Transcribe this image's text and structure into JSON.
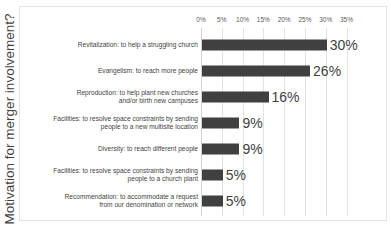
{
  "chart_data": {
    "type": "bar",
    "orientation": "horizontal",
    "title": "",
    "xlabel": "",
    "ylabel": "Motivation for merger involvement?",
    "xlim": [
      0,
      35
    ],
    "grid": true,
    "legend": "none",
    "x_ticks": [
      "0%",
      "5%",
      "10%",
      "15%",
      "20%",
      "25%",
      "30%",
      "35%"
    ],
    "x_tick_values": [
      0,
      5,
      10,
      15,
      20,
      25,
      30,
      35
    ],
    "categories": [
      "Revitalization: to help a struggling church",
      "Evangelism: to reach more people",
      "Reproduction: to help plant new churches and/or birth new campuses",
      "Facilities: to resolve space constraints by sending people to a new multisite location",
      "Diversity: to reach different people",
      "Facilities: to resolve space constraints by sending people to a church plant",
      "Recommendation: to accommodate a request from our denomination or network"
    ],
    "category_lines": [
      [
        "Revitalization: to help a struggling church"
      ],
      [
        "Evangelism: to reach more people"
      ],
      [
        "Reproduction: to help plant new churches",
        "and/or birth new campuses"
      ],
      [
        "Facilities: to resolve space constraints by sending",
        "people to a new multisite location"
      ],
      [
        "Diversity: to reach different people"
      ],
      [
        "Facilities: to resolve space constraints by sending",
        "people to a church plant"
      ],
      [
        "Recommendation: to accommodate a request",
        "from our denomination or network"
      ]
    ],
    "values": [
      30,
      26,
      16,
      9,
      9,
      5,
      5
    ],
    "data_labels": [
      "30%",
      "26%",
      "16%",
      "9%",
      "9%",
      "5%",
      "5%"
    ],
    "bar_color": "#404040",
    "grid_color": "#e2e2e2",
    "text_color": "#3f3f3f",
    "background": "#ffffff"
  }
}
